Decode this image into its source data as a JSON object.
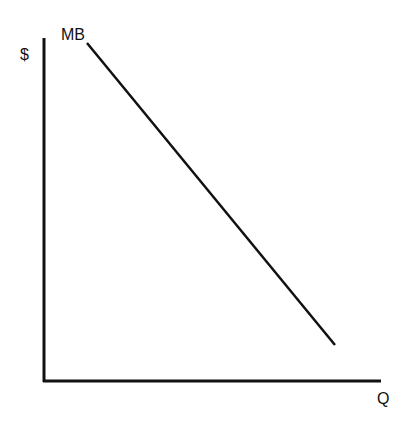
{
  "diagram": {
    "y_axis_label": "$",
    "x_axis_label": "Q",
    "curve_label": "MB",
    "curve": {
      "x1": 87,
      "y1": 43,
      "x2": 335,
      "y2": 345
    },
    "colors": {
      "line": "#111111",
      "background": "#ffffff"
    }
  }
}
